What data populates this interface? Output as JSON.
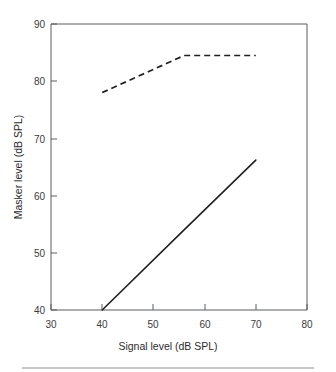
{
  "chart_data": {
    "type": "line",
    "title": "",
    "xlabel": "Signal level (dB SPL)",
    "ylabel": "Masker level (dB SPL)",
    "xlim": [
      30,
      80
    ],
    "ylim": [
      40,
      90
    ],
    "xticks": [
      30,
      40,
      50,
      60,
      70,
      80
    ],
    "yticks": [
      40,
      50,
      60,
      70,
      80,
      90
    ],
    "xtick_labels": [
      "30",
      "40",
      "50",
      "60",
      "70",
      "80"
    ],
    "ytick_labels": [
      "40",
      "50",
      "60",
      "70",
      "80",
      "90"
    ],
    "grid": false,
    "legend": "none",
    "series": [
      {
        "name": "dashed-upper-curve",
        "style": "dashed",
        "color": "#231f20",
        "x": [
          40,
          56,
          70
        ],
        "values": [
          78,
          84.5,
          84.5
        ]
      },
      {
        "name": "solid-lower-curve",
        "style": "solid",
        "color": "#231f20",
        "x": [
          40,
          56,
          70
        ],
        "values": [
          40,
          54,
          66.2
        ]
      }
    ]
  },
  "figure": {
    "axis_label_x": "Signal level (dB SPL)",
    "axis_label_y": "Masker level (dB SPL)"
  }
}
